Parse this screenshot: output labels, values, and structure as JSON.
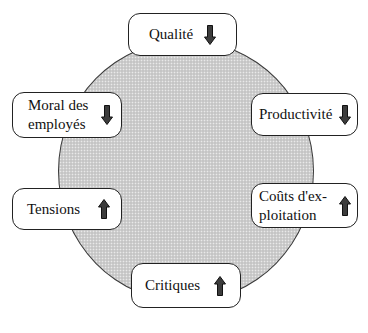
{
  "diagram": {
    "fill_color": "#cfcfcf",
    "border_color": "#222222",
    "arrow_color": "#3c3c3c",
    "nodes": [
      {
        "id": "qualite",
        "label": "Qualité",
        "trend": "down",
        "icon": "arrow-down-icon"
      },
      {
        "id": "productivite",
        "label": "Productivité",
        "trend": "down",
        "icon": "arrow-down-icon"
      },
      {
        "id": "couts",
        "label": "Coûts d'ex-\nploitation",
        "trend": "up",
        "icon": "arrow-up-icon"
      },
      {
        "id": "critiques",
        "label": "Critiques",
        "trend": "up",
        "icon": "arrow-up-icon"
      },
      {
        "id": "tensions",
        "label": "Tensions",
        "trend": "up",
        "icon": "arrow-up-icon"
      },
      {
        "id": "moral",
        "label": "Moral des\nemployés",
        "trend": "down",
        "icon": "arrow-down-icon"
      }
    ]
  }
}
